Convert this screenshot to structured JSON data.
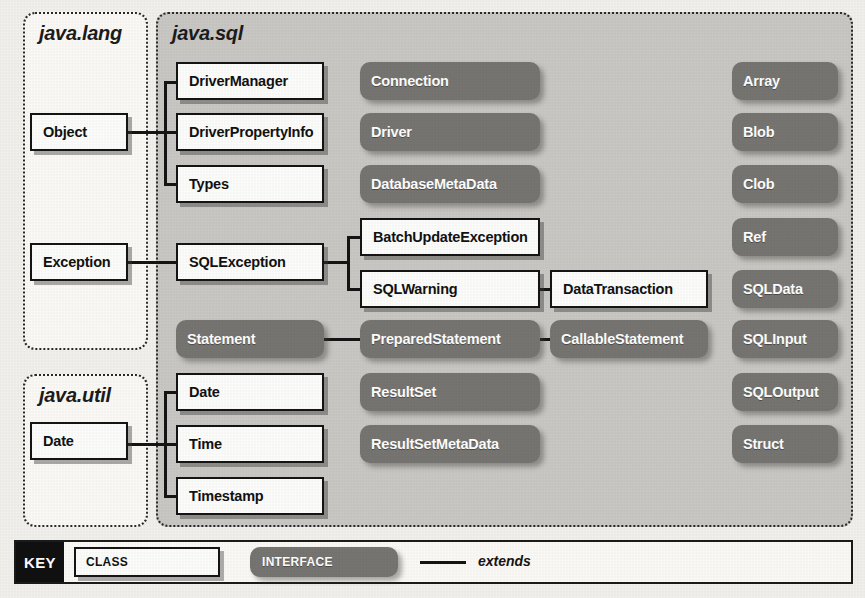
{
  "diagram": {
    "colors": {
      "page_background": "#f2f1ee",
      "shaded_package": "#c9c8c4",
      "light_package": "#fbfaf7",
      "class_fill": "#fdfdfb",
      "interface_fill": "#767571",
      "line": "#141414",
      "key_tag": "#101010"
    }
  },
  "packages": [
    {
      "id": "java-lang",
      "name": "java.lang",
      "style": "light",
      "x": 23,
      "y": 12,
      "w": 125,
      "h": 338
    },
    {
      "id": "java-util",
      "name": "java.util",
      "style": "light",
      "x": 23,
      "y": 374,
      "w": 125,
      "h": 153
    },
    {
      "id": "java-sql",
      "name": "java.sql",
      "style": "shaded",
      "x": 156,
      "y": 12,
      "w": 697,
      "h": 515
    }
  ],
  "nodes": [
    {
      "id": "object",
      "label": "Object",
      "kind": "class",
      "package": "java.lang",
      "x": 30,
      "y": 113,
      "w": 98,
      "h": 38
    },
    {
      "id": "exception",
      "label": "Exception",
      "kind": "class",
      "package": "java.lang",
      "x": 30,
      "y": 243,
      "w": 98,
      "h": 38
    },
    {
      "id": "util-date",
      "label": "Date",
      "kind": "class",
      "package": "java.util",
      "x": 30,
      "y": 422,
      "w": 98,
      "h": 38
    },
    {
      "id": "drivermanager",
      "label": "DriverManager",
      "kind": "class",
      "package": "java.sql",
      "x": 176,
      "y": 62,
      "w": 148,
      "h": 38
    },
    {
      "id": "driverpropertyinfo",
      "label": "DriverPropertyInfo",
      "kind": "class",
      "package": "java.sql",
      "x": 176,
      "y": 113,
      "w": 148,
      "h": 38
    },
    {
      "id": "types",
      "label": "Types",
      "kind": "class",
      "package": "java.sql",
      "x": 176,
      "y": 165,
      "w": 148,
      "h": 38
    },
    {
      "id": "sqlexception",
      "label": "SQLException",
      "kind": "class",
      "package": "java.sql",
      "x": 176,
      "y": 243,
      "w": 148,
      "h": 38
    },
    {
      "id": "connection",
      "label": "Connection",
      "kind": "interface",
      "package": "java.sql",
      "x": 360,
      "y": 62,
      "w": 180,
      "h": 38
    },
    {
      "id": "driver",
      "label": "Driver",
      "kind": "interface",
      "package": "java.sql",
      "x": 360,
      "y": 113,
      "w": 180,
      "h": 38
    },
    {
      "id": "databasemetadata",
      "label": "DatabaseMetaData",
      "kind": "interface",
      "package": "java.sql",
      "x": 360,
      "y": 165,
      "w": 180,
      "h": 38
    },
    {
      "id": "batchupdateexception",
      "label": "BatchUpdateException",
      "kind": "class",
      "package": "java.sql",
      "x": 360,
      "y": 218,
      "w": 180,
      "h": 38
    },
    {
      "id": "sqlwarning",
      "label": "SQLWarning",
      "kind": "class",
      "package": "java.sql",
      "x": 360,
      "y": 270,
      "w": 180,
      "h": 38
    },
    {
      "id": "datatransaction",
      "label": "DataTransaction",
      "kind": "class",
      "package": "java.sql",
      "x": 550,
      "y": 270,
      "w": 158,
      "h": 38
    },
    {
      "id": "statement",
      "label": "Statement",
      "kind": "interface",
      "package": "java.sql",
      "x": 176,
      "y": 320,
      "w": 148,
      "h": 38
    },
    {
      "id": "preparedstatement",
      "label": "PreparedStatement",
      "kind": "interface",
      "package": "java.sql",
      "x": 360,
      "y": 320,
      "w": 180,
      "h": 38
    },
    {
      "id": "callablestatement",
      "label": "CallableStatement",
      "kind": "interface",
      "package": "java.sql",
      "x": 550,
      "y": 320,
      "w": 158,
      "h": 38
    },
    {
      "id": "sql-date",
      "label": "Date",
      "kind": "class",
      "package": "java.sql",
      "x": 176,
      "y": 373,
      "w": 148,
      "h": 38
    },
    {
      "id": "sql-time",
      "label": "Time",
      "kind": "class",
      "package": "java.sql",
      "x": 176,
      "y": 425,
      "w": 148,
      "h": 38
    },
    {
      "id": "sql-timestamp",
      "label": "Timestamp",
      "kind": "class",
      "package": "java.sql",
      "x": 176,
      "y": 477,
      "w": 148,
      "h": 38
    },
    {
      "id": "resultset",
      "label": "ResultSet",
      "kind": "interface",
      "package": "java.sql",
      "x": 360,
      "y": 373,
      "w": 180,
      "h": 38
    },
    {
      "id": "resultsetmetadata",
      "label": "ResultSetMetaData",
      "kind": "interface",
      "package": "java.sql",
      "x": 360,
      "y": 425,
      "w": 180,
      "h": 38
    },
    {
      "id": "array",
      "label": "Array",
      "kind": "interface",
      "package": "java.sql",
      "x": 732,
      "y": 62,
      "w": 106,
      "h": 38
    },
    {
      "id": "blob",
      "label": "Blob",
      "kind": "interface",
      "package": "java.sql",
      "x": 732,
      "y": 113,
      "w": 106,
      "h": 38
    },
    {
      "id": "clob",
      "label": "Clob",
      "kind": "interface",
      "package": "java.sql",
      "x": 732,
      "y": 165,
      "w": 106,
      "h": 38
    },
    {
      "id": "ref",
      "label": "Ref",
      "kind": "interface",
      "package": "java.sql",
      "x": 732,
      "y": 218,
      "w": 106,
      "h": 38
    },
    {
      "id": "sqldata",
      "label": "SQLData",
      "kind": "interface",
      "package": "java.sql",
      "x": 732,
      "y": 270,
      "w": 106,
      "h": 38
    },
    {
      "id": "sqlinput",
      "label": "SQLInput",
      "kind": "interface",
      "package": "java.sql",
      "x": 732,
      "y": 320,
      "w": 106,
      "h": 38
    },
    {
      "id": "sqloutput",
      "label": "SQLOutput",
      "kind": "interface",
      "package": "java.sql",
      "x": 732,
      "y": 373,
      "w": 106,
      "h": 38
    },
    {
      "id": "struct",
      "label": "Struct",
      "kind": "interface",
      "package": "java.sql",
      "x": 732,
      "y": 425,
      "w": 106,
      "h": 38
    }
  ],
  "edges": [
    {
      "from": "object",
      "to": "drivermanager",
      "relation": "extends"
    },
    {
      "from": "object",
      "to": "driverpropertyinfo",
      "relation": "extends"
    },
    {
      "from": "object",
      "to": "types",
      "relation": "extends"
    },
    {
      "from": "exception",
      "to": "sqlexception",
      "relation": "extends"
    },
    {
      "from": "sqlexception",
      "to": "batchupdateexception",
      "relation": "extends"
    },
    {
      "from": "sqlexception",
      "to": "sqlwarning",
      "relation": "extends"
    },
    {
      "from": "sqlwarning",
      "to": "datatransaction",
      "relation": "extends"
    },
    {
      "from": "statement",
      "to": "preparedstatement",
      "relation": "extends"
    },
    {
      "from": "preparedstatement",
      "to": "callablestatement",
      "relation": "extends"
    },
    {
      "from": "util-date",
      "to": "sql-date",
      "relation": "extends"
    },
    {
      "from": "util-date",
      "to": "sql-time",
      "relation": "extends"
    },
    {
      "from": "util-date",
      "to": "sql-timestamp",
      "relation": "extends"
    }
  ],
  "key": {
    "tag_label": "KEY",
    "class_label": "CLASS",
    "interface_label": "INTERFACE",
    "extends_label": "extends"
  }
}
